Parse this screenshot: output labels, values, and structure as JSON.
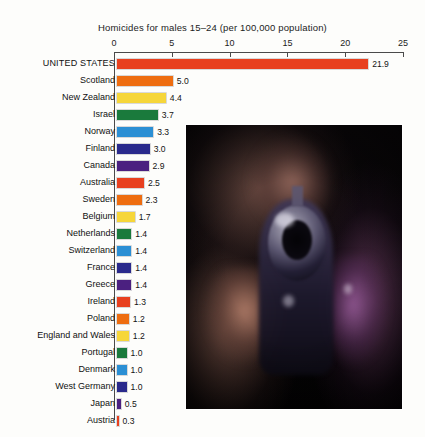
{
  "chart_data": {
    "type": "bar",
    "orientation": "horizontal",
    "title": "Homicides for males 15–24 (per 100,000 population)",
    "xlabel": "",
    "ylabel": "",
    "xlim": [
      0,
      25
    ],
    "xticks": [
      0,
      5,
      10,
      15,
      20,
      25
    ],
    "xtick_labels": [
      "0",
      "5",
      "10",
      "15",
      "20",
      "25"
    ],
    "grid": false,
    "legend": "none",
    "categories": [
      "UNITED STATES",
      "Scotland",
      "New Zealand",
      "Israel",
      "Norway",
      "Finland",
      "Canada",
      "Australia",
      "Sweden",
      "Belgium",
      "Netherlands",
      "Switzerland",
      "France",
      "Greece",
      "Ireland",
      "Poland",
      "England and Wales",
      "Portugal",
      "Denmark",
      "West Germany",
      "Japan",
      "Austria"
    ],
    "values": [
      21.9,
      5.0,
      4.4,
      3.7,
      3.3,
      3.0,
      2.9,
      2.5,
      2.3,
      1.7,
      1.4,
      1.4,
      1.4,
      1.4,
      1.3,
      1.2,
      1.2,
      1.0,
      1.0,
      1.0,
      0.5,
      0.3
    ],
    "value_labels": [
      "21.9",
      "5.0",
      "4.4",
      "3.7",
      "3.3",
      "3.0",
      "2.9",
      "2.5",
      "2.3",
      "1.7",
      "1.4",
      "1.4",
      "1.4",
      "1.4",
      "1.3",
      "1.2",
      "1.2",
      "1.0",
      "1.0",
      "1.0",
      "0.5",
      "0.3"
    ],
    "bar_colors": [
      "#e8401f",
      "#ee6d10",
      "#f6d63a",
      "#1a7a3c",
      "#2b8fd4",
      "#2a2a8c",
      "#4b2080",
      "#e8401f",
      "#ee6d10",
      "#f6d63a",
      "#1a7a3c",
      "#2b8fd4",
      "#2a2a8c",
      "#4b2080",
      "#e8401f",
      "#ee6d10",
      "#f6d63a",
      "#1a7a3c",
      "#2b8fd4",
      "#2a2a8c",
      "#4b2080",
      "#e8401f"
    ]
  },
  "photo": {
    "alt": "Close-up photograph of a handgun barrel pointed toward the viewer, held in two hands in front of a dimly lit face"
  }
}
